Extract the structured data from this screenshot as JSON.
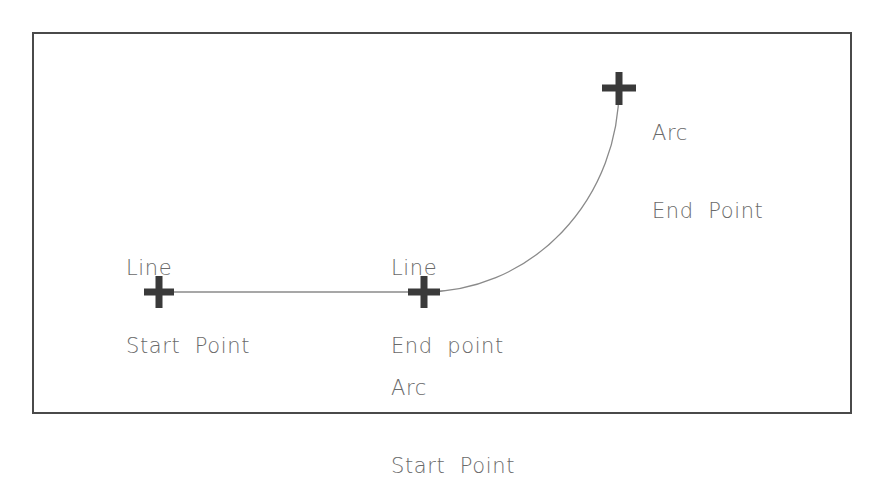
{
  "diagram": {
    "frame": {
      "x": 33,
      "y": 33,
      "width": 818,
      "height": 380,
      "stroke": "#4a4a4a",
      "stroke_width": 2
    },
    "colors": {
      "marker": "#3a3a3a",
      "line": "#8a8a8a",
      "text": "#6a6a6a"
    },
    "points": [
      {
        "id": "line-start",
        "x": 159,
        "y": 292,
        "icon": "cross-marker-icon"
      },
      {
        "id": "line-end-arc-start",
        "x": 424,
        "y": 292,
        "icon": "cross-marker-icon"
      },
      {
        "id": "arc-end",
        "x": 619,
        "y": 88,
        "icon": "cross-marker-icon"
      }
    ],
    "segments": [
      {
        "type": "line",
        "from": [
          159,
          292
        ],
        "to": [
          424,
          292
        ]
      },
      {
        "type": "arc",
        "from": [
          424,
          292
        ],
        "to": [
          619,
          88
        ],
        "rx": 195,
        "ry": 204
      }
    ],
    "labels": {
      "line_start": {
        "line1": "Line",
        "line2": "Start  Point"
      },
      "line_end": {
        "line1": "Line",
        "line2": "End  point"
      },
      "arc_start": {
        "line1": "Arc",
        "line2": "Start  Point"
      },
      "arc_end": {
        "line1": "Arc",
        "line2": "End  Point"
      }
    }
  }
}
